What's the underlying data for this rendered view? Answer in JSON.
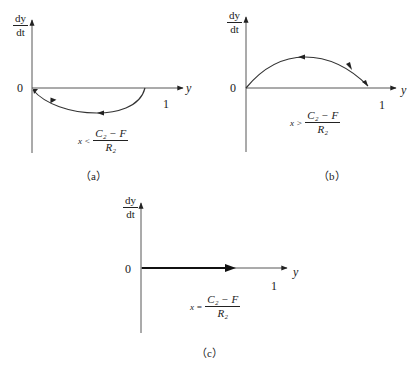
{
  "panels": [
    {
      "id": "a",
      "y_axis_label_num": "dy",
      "y_axis_label_den": "dt",
      "x_axis_label": "y",
      "origin_label": "0",
      "tick_label": "1",
      "condition_lhs": "x <",
      "condition_num": "C₂ − F",
      "condition_den": "R₂",
      "caption": "（a）",
      "curve": "semicircle below axis from y=1 back to 0, arrows pointing toward origin"
    },
    {
      "id": "b",
      "y_axis_label_num": "dy",
      "y_axis_label_den": "dt",
      "x_axis_label": "y",
      "origin_label": "0",
      "tick_label": "1",
      "condition_lhs": "x >",
      "condition_num": "C₂ − F",
      "condition_den": "R₂",
      "caption": "（b）",
      "curve": "arc above axis from 0 to 1, arrows pointing toward y=1"
    },
    {
      "id": "c",
      "y_axis_label_num": "dy",
      "y_axis_label_den": "dt",
      "x_axis_label": "y",
      "origin_label": "0",
      "tick_label": "1",
      "condition_lhs": "x =",
      "condition_num": "C₂ − F",
      "condition_den": "R₂",
      "caption": "（c）",
      "curve": "thick horizontal segment along axis with arrow"
    }
  ]
}
